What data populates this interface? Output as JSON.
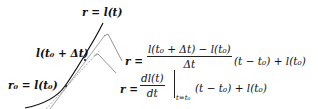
{
  "diagram": {
    "curve_label": "r = l(t)",
    "point_a_label": "l(t₀ + Δt)",
    "point_b_label": "r₀ = l(t₀)",
    "secant_eq": {
      "lhs": "r =",
      "numerator": "l(t₀ + Δt) − l(t₀)",
      "denominator": "Δt",
      "rhs": "(t − t₀) + l(t₀)"
    },
    "tangent_eq": {
      "lhs": "r =",
      "numerator": "dl(t)",
      "denominator": "dt",
      "eval_subscript": "t=t₀",
      "rhs": "(t − t₀) + l(t₀)"
    },
    "colors": {
      "curve": "#111111",
      "secant_line": "#888888",
      "tangent_line": "#999999",
      "leader_line": "#777777"
    }
  }
}
